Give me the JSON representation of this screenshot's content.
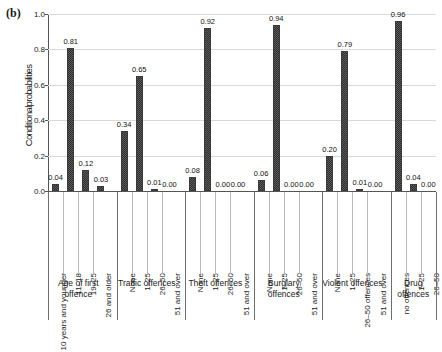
{
  "figure": {
    "panel_letter": "(b)",
    "ylabel": "Conditionalprobabilities"
  },
  "chart_data": {
    "type": "bar",
    "title": "",
    "subtitle": "",
    "xlabel": "",
    "ylabel": "Conditionalprobabilities",
    "ylim": [
      0.0,
      1.0
    ],
    "yticks": [
      "1.0",
      "0.8",
      "0.6",
      "0.4",
      "0.2",
      "0.0"
    ],
    "ytick_values": [
      1.0,
      0.8,
      0.6,
      0.4,
      0.2,
      0.0
    ],
    "grid": true,
    "legend": "none",
    "value_label_format": "2dp",
    "groups": [
      {
        "name": "Age of first offence",
        "categories": [
          "10 years and younger",
          "11–18",
          "19–25",
          "26 and older"
        ],
        "values": [
          0.04,
          0.81,
          0.12,
          0.03
        ],
        "labels": [
          "0.04",
          "0.81",
          "0.12",
          "0.03"
        ]
      },
      {
        "name": "Traffic offences",
        "categories": [
          "None",
          "1–25",
          "26–50",
          "51 and over"
        ],
        "values": [
          0.34,
          0.65,
          0.01,
          0.0
        ],
        "labels": [
          "0.34",
          "0.65",
          "0.01",
          "0.00"
        ]
      },
      {
        "name": "Theft offences",
        "categories": [
          "None",
          "1–25",
          "26–50",
          "51 and over"
        ],
        "values": [
          0.08,
          0.92,
          0.0,
          0.0
        ],
        "labels": [
          "0.08",
          "0.92",
          "0.00",
          "0.00"
        ]
      },
      {
        "name": "Burglary offences",
        "categories": [
          "None",
          "1–25",
          "26–50",
          "51 and over"
        ],
        "values": [
          0.06,
          0.94,
          0.0,
          0.0
        ],
        "labels": [
          "0.06",
          "0.94",
          "0.00",
          "0.00"
        ]
      },
      {
        "name": "Violent offences",
        "categories": [
          "None",
          "1–25",
          "26–50 offences",
          "51 and over"
        ],
        "values": [
          0.2,
          0.79,
          0.01,
          0.0
        ],
        "labels": [
          "0.20",
          "0.79",
          "0.01",
          "0.00"
        ]
      },
      {
        "name": "Drug offences",
        "categories": [
          "no offences",
          "1–25",
          "26–50"
        ],
        "values": [
          0.96,
          0.04,
          0.0
        ],
        "labels": [
          "0.96",
          "0.04",
          "0.00"
        ]
      }
    ],
    "colors": {
      "bar_fill": "#5b5b5b",
      "bar_pattern": "#2e2e2e",
      "axis": "#555555",
      "grid": "#d9d9d9",
      "text": "#1a1a1a"
    }
  }
}
